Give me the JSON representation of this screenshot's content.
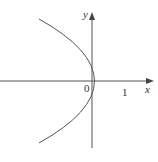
{
  "diagram": {
    "type": "graph",
    "axes": {
      "x_label": "x",
      "y_label": "y",
      "origin_label": "0",
      "x_tick_label": "1"
    },
    "curve": {
      "equation": "x = 1 - y^2",
      "vertex": [
        1,
        0
      ],
      "y_intercepts": [
        1,
        -1
      ],
      "color": "#555555"
    },
    "colors": {
      "axis": "#555555",
      "curve": "#555555",
      "background": "#ffffff"
    }
  }
}
